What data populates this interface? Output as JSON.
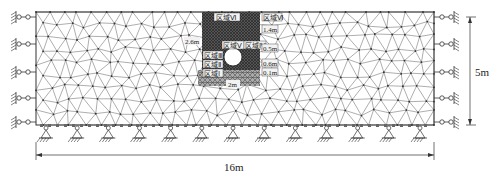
{
  "diagram": {
    "colors": {
      "mesh_line": "#4a4a4a",
      "dense_zone": "#3a3a3a",
      "label_bg": "#f2f2f2",
      "tunnel": "#ffffff"
    },
    "zones": [
      {
        "id": "zone-6",
        "label": "区域Ⅵ"
      },
      {
        "id": "zone-5",
        "label": "区域Ⅴ"
      },
      {
        "id": "zone-4",
        "label": "区域Ⅳ"
      },
      {
        "id": "zone-3",
        "label": "区域Ⅲ"
      },
      {
        "id": "zone-2",
        "label": "区域Ⅱ"
      },
      {
        "id": "zone-1",
        "label": "区域Ⅰ"
      },
      {
        "id": "zone-6-right",
        "label": "区域Ⅵ"
      }
    ],
    "inner_dimensions": {
      "left_height": "2.6m",
      "right_top": "1.4m",
      "right_mid": "0.5m",
      "right_low1": "0.6m",
      "right_low2": "0.1m",
      "bottom_width": "2m"
    },
    "outer_dimensions": {
      "width": "16m",
      "height": "5m"
    },
    "boundary": {
      "left_rollers": 5,
      "right_rollers": 5,
      "bottom_pins": 13
    }
  }
}
